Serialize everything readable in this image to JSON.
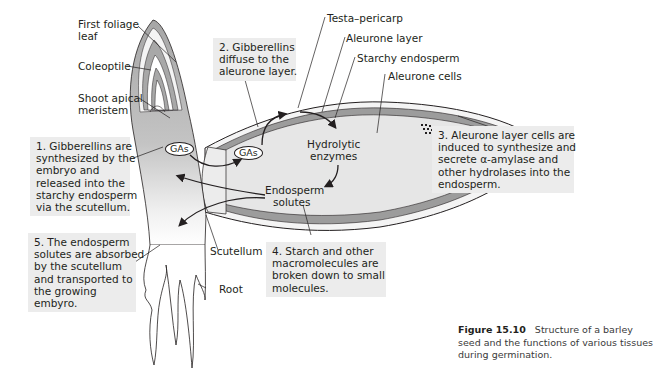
{
  "figure": {
    "number": "Figure 15.10",
    "caption_lines": [
      "Structure of a barley",
      "seed and the functions of various tissues",
      "during germination."
    ]
  },
  "labels": {
    "first_foliage_leaf": [
      "First foliage",
      "leaf"
    ],
    "coleoptile": "Coleoptile",
    "shoot_apical_meristem": [
      "Shoot apical",
      "meristem"
    ],
    "testa_pericarp": "Testa–pericarp",
    "aleurone_layer": "Aleurone layer",
    "starchy_endosperm": "Starchy endosperm",
    "aleurone_cells": "Aleurone cells",
    "scutellum": "Scutellum",
    "root": "Root"
  },
  "inner_labels": {
    "gas_embryo": "GAs",
    "gas_endosperm": "GAs",
    "hydrolytic_enzymes": [
      "Hydrolytic",
      "enzymes"
    ],
    "endosperm_solutes": [
      "Endosperm",
      "solutes"
    ]
  },
  "steps": [
    {
      "id": 1,
      "lines": [
        "1. Gibberellins are",
        "synthesized by the",
        "embryo and",
        "released into the",
        "starchy endosperm",
        "via the scutellum."
      ]
    },
    {
      "id": 2,
      "lines": [
        "2. Gibberellins",
        "diffuse to the",
        "aleurone layer."
      ]
    },
    {
      "id": 3,
      "lines": [
        "3. Aleurone layer cells are",
        "induced to synthesize and",
        "secrete α-amylase and",
        "other hydrolases into the",
        "endosperm."
      ]
    },
    {
      "id": 4,
      "lines": [
        "4. Starch and other",
        "macromolecules are",
        "broken down to small",
        "molecules."
      ]
    },
    {
      "id": 5,
      "lines": [
        "5. The endosperm",
        "solutes are absorbed",
        "by the scutellum",
        "and transported to",
        "the growing",
        "embyro."
      ]
    }
  ],
  "colors": {
    "box_bg": "#ececec",
    "aleurone": "#9a9a9a",
    "endosperm": "#e6e6e6",
    "embryo_dark": "#a8a8a8",
    "line": "#231f20"
  }
}
